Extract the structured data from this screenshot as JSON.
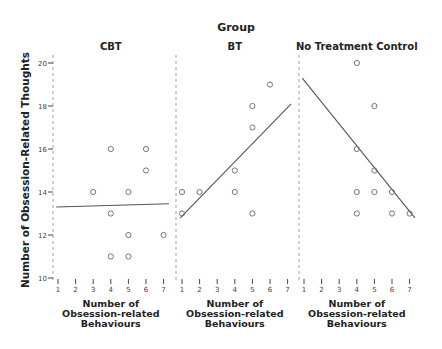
{
  "chart_data": {
    "type": "scatter",
    "title": "Group",
    "ylabel": "Number of Obsession-Related Thoughts",
    "xlabel": "Number of Obsession-related Behaviours",
    "ylim": [
      10,
      20
    ],
    "xlim": [
      1,
      7
    ],
    "yticks": [
      10,
      12,
      14,
      16,
      18,
      20
    ],
    "xticks": [
      1,
      2,
      3,
      4,
      5,
      6,
      7
    ],
    "grid": false,
    "panels": [
      {
        "name": "CBT",
        "points": [
          [
            3,
            14
          ],
          [
            4,
            16
          ],
          [
            4,
            13
          ],
          [
            4,
            11
          ],
          [
            5,
            14
          ],
          [
            5,
            12
          ],
          [
            5,
            11
          ],
          [
            6,
            16
          ],
          [
            6,
            15
          ],
          [
            7,
            12
          ]
        ],
        "fit_line": {
          "x": [
            0.9,
            7.3
          ],
          "y": [
            13.3,
            13.45
          ]
        }
      },
      {
        "name": "BT",
        "points": [
          [
            1,
            14
          ],
          [
            1,
            13
          ],
          [
            2,
            14
          ],
          [
            4,
            15
          ],
          [
            4,
            14
          ],
          [
            5,
            18
          ],
          [
            5,
            17
          ],
          [
            5,
            13
          ],
          [
            6,
            19
          ]
        ],
        "fit_line": {
          "x": [
            0.9,
            7.2
          ],
          "y": [
            12.8,
            18.1
          ]
        }
      },
      {
        "name": "No Treatment Control",
        "points": [
          [
            4,
            20
          ],
          [
            4,
            16
          ],
          [
            4,
            14
          ],
          [
            4,
            13
          ],
          [
            5,
            18
          ],
          [
            5,
            15
          ],
          [
            5,
            14
          ],
          [
            6,
            14
          ],
          [
            6,
            13
          ],
          [
            7,
            13
          ]
        ],
        "fit_line": {
          "x": [
            0.9,
            7.3
          ],
          "y": [
            19.3,
            12.8
          ]
        }
      }
    ]
  },
  "labels": {
    "title": "Group",
    "ylabel": "Number of Obsession-Related Thoughts",
    "xlabel_line1": "Number of",
    "xlabel_line2": "Obsession-related",
    "xlabel_line3": "Behaviours",
    "panel_titles": [
      "CBT",
      "BT",
      "No Treatment Control"
    ]
  }
}
